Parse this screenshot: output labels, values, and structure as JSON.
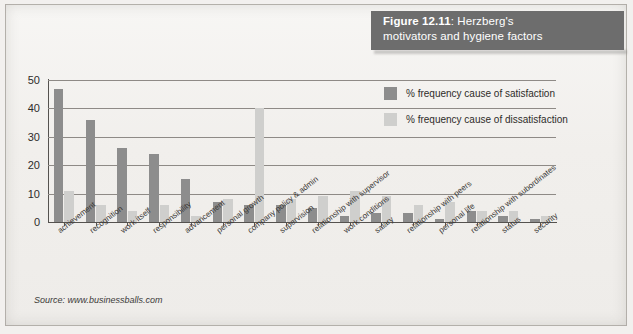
{
  "figure": {
    "caption_prefix": "Figure 12.11",
    "caption_sep": ": ",
    "caption_line1_rest": "Herzberg's",
    "caption_line2": "motivators and hygiene factors",
    "banner_color": "#6d6d6d"
  },
  "source": {
    "text": "Source: www.businessballs.com"
  },
  "legend": {
    "position": "top-right",
    "items": [
      {
        "label": "% frequency cause of satisfaction",
        "color": "#8d8d8d",
        "name": "satisfaction"
      },
      {
        "label": "% frequency cause of dissatisfaction",
        "color": "#cfcfcd",
        "name": "dissatisfaction"
      }
    ]
  },
  "axis": {
    "y_ticks": [
      "0",
      "10",
      "20",
      "30",
      "40",
      "50"
    ],
    "y_min": 0,
    "y_max": 50,
    "grid": true
  },
  "chart_data": {
    "type": "bar",
    "title": "Figure 12.11: Herzberg's motivators and hygiene factors",
    "subtitle": "",
    "xlabel": "",
    "ylabel": "",
    "ylim": [
      0,
      50
    ],
    "yticks": [
      0,
      10,
      20,
      30,
      40,
      50
    ],
    "grid": true,
    "legend_position": "top-right",
    "source": "Source: www.businessballs.com",
    "categories": [
      "achievement",
      "recognition",
      "work itself",
      "responsibility",
      "advancement",
      "personal growth",
      "company policy & admin",
      "supervision",
      "relationship with supervisor",
      "work conditions",
      "salary",
      "relationship with peers",
      "personal life",
      "relationship with subordinates",
      "status",
      "security"
    ],
    "series": [
      {
        "name": "% frequency cause of satisfaction",
        "color": "#8d8d8d",
        "values": [
          47,
          36,
          26,
          24,
          15,
          7,
          6,
          6,
          5,
          2,
          3,
          3,
          1,
          4,
          2,
          1
        ]
      },
      {
        "name": "% frequency cause of dissatisfaction",
        "color": "#cfcfcd",
        "values": [
          11,
          6,
          4,
          6,
          2,
          8,
          40,
          8,
          9,
          11,
          9,
          6,
          7,
          4,
          4,
          2
        ]
      }
    ]
  }
}
